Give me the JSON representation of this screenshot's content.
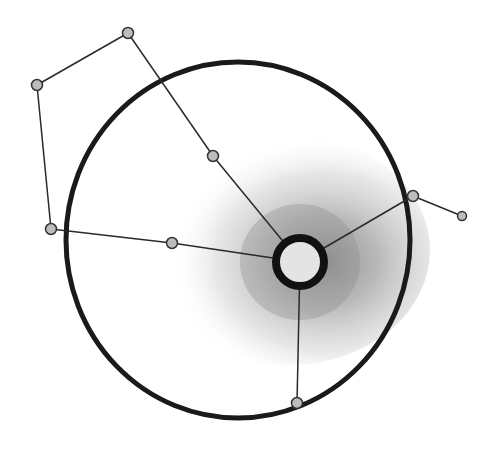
{
  "diagram": {
    "colors": {
      "background": "#ffffff",
      "stroke": "#1a1a1a",
      "node_fill": "#bdbdbd",
      "shade_dark": "#8a8a8a",
      "shade_light": "#d9d9d9"
    },
    "outer_circle": {
      "cx": 238,
      "cy": 240,
      "rx": 172,
      "ry": 178
    },
    "hub": {
      "cx": 300,
      "cy": 262,
      "r": 24
    },
    "nodes": [
      {
        "id": "n1",
        "x": 128,
        "y": 33
      },
      {
        "id": "n2",
        "x": 37,
        "y": 85
      },
      {
        "id": "n3",
        "x": 51,
        "y": 229
      },
      {
        "id": "n4",
        "x": 172,
        "y": 243
      },
      {
        "id": "n5",
        "x": 213,
        "y": 156
      },
      {
        "id": "n6",
        "x": 413,
        "y": 196
      },
      {
        "id": "n7",
        "x": 462,
        "y": 216
      },
      {
        "id": "n8",
        "x": 297,
        "y": 403
      }
    ],
    "edges": [
      [
        "n1",
        "n2"
      ],
      [
        "n2",
        "n3"
      ],
      [
        "n3",
        "n4"
      ],
      [
        "n4",
        "hub"
      ],
      [
        "n1",
        "n5"
      ],
      [
        "n5",
        "hub"
      ],
      [
        "hub",
        "n6"
      ],
      [
        "n6",
        "n7"
      ],
      [
        "hub",
        "n8"
      ]
    ]
  }
}
